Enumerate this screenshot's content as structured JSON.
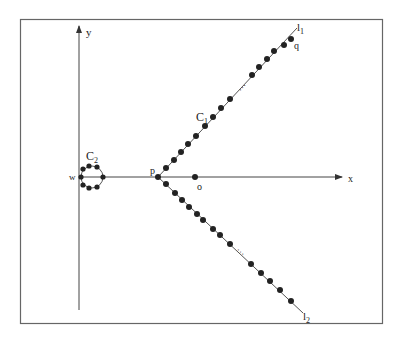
{
  "figure": {
    "frame": {
      "x": 20,
      "y": 19,
      "w": 362,
      "h": 304,
      "stroke": "#555555"
    },
    "axes": {
      "x_label": "x",
      "y_label": "y",
      "origin_x": 79,
      "axis_y": 177,
      "x_end": 342,
      "y_top": 27,
      "y_bottom": 310
    },
    "points": {
      "p": {
        "label": "p",
        "x": 158,
        "y": 177
      },
      "o": {
        "label": "o",
        "x": 195,
        "y": 177
      },
      "w": {
        "label": "w",
        "x": 80,
        "y": 177
      },
      "q": {
        "label": "q",
        "x": 287,
        "y": 37
      }
    },
    "lines": {
      "l1": {
        "label": "l",
        "sub": "1",
        "x1": 158,
        "y1": 177,
        "x2": 297,
        "y2": 28
      },
      "l2": {
        "label": "l",
        "sub": "2",
        "x1": 158,
        "y1": 177,
        "x2": 303,
        "y2": 313
      }
    },
    "curves": {
      "C1": {
        "label": "C",
        "sub": "1",
        "x": 196,
        "y": 117
      },
      "C2": {
        "label": "C",
        "sub": "2",
        "cx": 92,
        "cy": 177,
        "r": 11,
        "label_x": 88,
        "label_y": 158
      }
    },
    "ellipsis": "…",
    "dot_color": "#222222",
    "line_color": "#555555"
  }
}
